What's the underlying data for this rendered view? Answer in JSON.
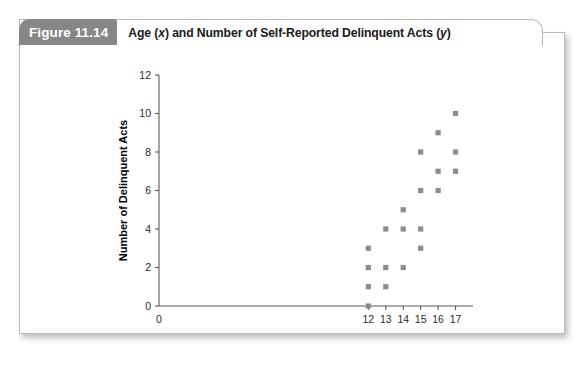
{
  "figure": {
    "badge": "Figure 11.14",
    "title_prefix": "Age (",
    "title_var_x": "x",
    "title_middle": ") and Number of Self-Reported Delinquent Acts (",
    "title_var_y": "y",
    "title_suffix": ")",
    "title_full": "Age (x) and Number of Self-Reported Delinquent Acts (y)"
  },
  "colors": {
    "badge_background": "#878787",
    "badge_text": "#ffffff",
    "card_border": "#b9b9b9",
    "marker": "#8c8c8c",
    "axis": "#58585a",
    "background": "#ffffff"
  },
  "chart_data": {
    "type": "scatter",
    "title": "Age (x) and Number of Self-Reported Delinquent Acts (y)",
    "xlabel": "Age",
    "ylabel": "Number of Delinquent Acts",
    "xlim": [
      0,
      18
    ],
    "ylim": [
      0,
      12
    ],
    "grid": false,
    "legend": null,
    "xticks": [
      0,
      12,
      13,
      14,
      15,
      16,
      17
    ],
    "xtick_labels": [
      "0",
      "12",
      "13",
      "14",
      "15",
      "16",
      "17"
    ],
    "yticks": [
      0,
      2,
      4,
      6,
      8,
      10,
      12
    ],
    "ytick_labels": [
      "0",
      "2",
      "4",
      "6",
      "8",
      "10",
      "12"
    ],
    "marker_style": "square",
    "points": [
      {
        "x": 12,
        "y": 0
      },
      {
        "x": 12,
        "y": 1
      },
      {
        "x": 12,
        "y": 2
      },
      {
        "x": 12,
        "y": 3
      },
      {
        "x": 13,
        "y": 1
      },
      {
        "x": 13,
        "y": 2
      },
      {
        "x": 13,
        "y": 4
      },
      {
        "x": 14,
        "y": 2
      },
      {
        "x": 14,
        "y": 4
      },
      {
        "x": 14,
        "y": 5
      },
      {
        "x": 15,
        "y": 3
      },
      {
        "x": 15,
        "y": 4
      },
      {
        "x": 15,
        "y": 6
      },
      {
        "x": 15,
        "y": 8
      },
      {
        "x": 16,
        "y": 6
      },
      {
        "x": 16,
        "y": 7
      },
      {
        "x": 16,
        "y": 9
      },
      {
        "x": 17,
        "y": 7
      },
      {
        "x": 17,
        "y": 8
      },
      {
        "x": 17,
        "y": 10
      }
    ]
  }
}
